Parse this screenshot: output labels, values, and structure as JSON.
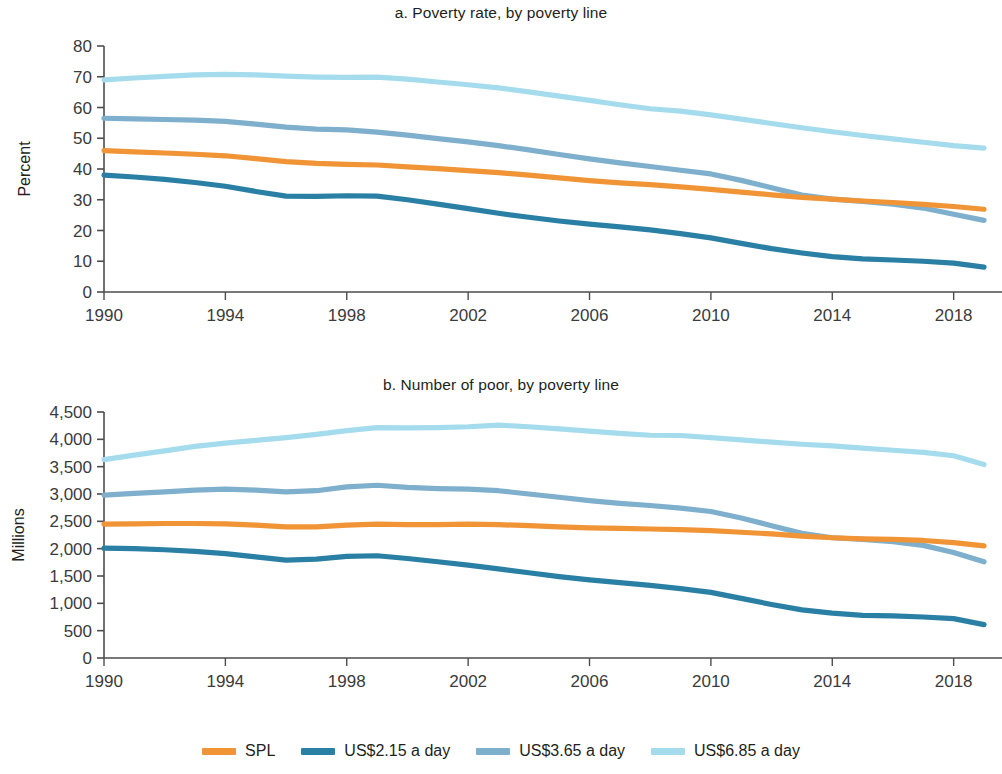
{
  "figure": {
    "panels": [
      {
        "id": "a",
        "title": "a. Poverty rate, by poverty line"
      },
      {
        "id": "b",
        "title": "b. Number of poor, by poverty line"
      }
    ]
  },
  "legend": {
    "items": [
      {
        "label": "SPL",
        "color": "#f09436"
      },
      {
        "label": "US$2.15 a day",
        "color": "#2a7fa5"
      },
      {
        "label": "US$3.65 a day",
        "color": "#7eafcd"
      },
      {
        "label": "US$6.85 a day",
        "color": "#a5dced"
      }
    ]
  },
  "chart_data": [
    {
      "type": "line",
      "title": "a. Poverty rate, by poverty line",
      "xlabel": "",
      "ylabel": "Percent",
      "xlim": [
        1990,
        2019
      ],
      "ylim": [
        0,
        80
      ],
      "yticks": [
        0,
        10,
        20,
        30,
        40,
        50,
        60,
        70,
        80
      ],
      "ytick_labels": [
        "0",
        "10",
        "20",
        "30",
        "40",
        "50",
        "60",
        "70",
        "80"
      ],
      "xticks": [
        1990,
        1994,
        1998,
        2002,
        2006,
        2010,
        2014,
        2018
      ],
      "xtick_labels": [
        "1990",
        "1994",
        "1998",
        "2002",
        "2006",
        "2010",
        "2014",
        "2018"
      ],
      "grid": false,
      "legend_position": "bottom",
      "x": [
        1990,
        1991,
        1992,
        1993,
        1994,
        1995,
        1996,
        1997,
        1998,
        1999,
        2000,
        2001,
        2002,
        2003,
        2004,
        2005,
        2006,
        2007,
        2008,
        2009,
        2010,
        2011,
        2012,
        2013,
        2014,
        2015,
        2016,
        2017,
        2018,
        2019
      ],
      "series": [
        {
          "name": "US$6.85 a day",
          "color": "#a5dced",
          "values": [
            69.0,
            69.6,
            70.1,
            70.6,
            70.8,
            70.6,
            70.2,
            69.9,
            69.8,
            69.9,
            69.2,
            68.3,
            67.4,
            66.4,
            65.1,
            63.7,
            62.3,
            60.9,
            59.6,
            58.8,
            57.6,
            56.2,
            54.8,
            53.4,
            52.1,
            50.9,
            49.8,
            48.7,
            47.6,
            46.8
          ]
        },
        {
          "name": "US$3.65 a day",
          "color": "#7eafcd",
          "values": [
            56.5,
            56.3,
            56.1,
            55.9,
            55.5,
            54.6,
            53.6,
            53.0,
            52.7,
            52.0,
            51.0,
            49.9,
            48.8,
            47.6,
            46.2,
            44.7,
            43.3,
            42.0,
            40.8,
            39.6,
            38.4,
            36.3,
            33.9,
            31.5,
            30.2,
            29.5,
            28.6,
            27.3,
            25.3,
            23.3
          ]
        },
        {
          "name": "SPL",
          "color": "#f09436",
          "values": [
            46.0,
            45.6,
            45.2,
            44.8,
            44.3,
            43.4,
            42.4,
            41.8,
            41.5,
            41.3,
            40.7,
            40.1,
            39.5,
            38.8,
            38.0,
            37.1,
            36.2,
            35.5,
            34.9,
            34.2,
            33.4,
            32.5,
            31.6,
            30.8,
            30.2,
            29.6,
            29.1,
            28.5,
            27.8,
            26.9
          ]
        },
        {
          "name": "US$2.15 a day",
          "color": "#2a7fa5",
          "values": [
            38.0,
            37.4,
            36.6,
            35.6,
            34.4,
            32.7,
            31.2,
            31.1,
            31.3,
            31.2,
            30.0,
            28.6,
            27.1,
            25.6,
            24.3,
            23.1,
            22.1,
            21.2,
            20.2,
            19.0,
            17.6,
            15.8,
            14.1,
            12.7,
            11.5,
            10.8,
            10.4,
            10.0,
            9.4,
            8.1
          ]
        }
      ]
    },
    {
      "type": "line",
      "title": "b. Number of poor, by poverty line",
      "xlabel": "",
      "ylabel": "Millions",
      "xlim": [
        1990,
        2019
      ],
      "ylim": [
        0,
        4500
      ],
      "yticks": [
        0,
        500,
        1000,
        1500,
        2000,
        2500,
        3000,
        3500,
        4000,
        4500
      ],
      "ytick_labels": [
        "0",
        "500",
        "1,000",
        "1,500",
        "2,000",
        "2,500",
        "3,000",
        "3,500",
        "4,000",
        "4,500"
      ],
      "xticks": [
        1990,
        1994,
        1998,
        2002,
        2006,
        2010,
        2014,
        2018
      ],
      "xtick_labels": [
        "1990",
        "1994",
        "1998",
        "2002",
        "2006",
        "2010",
        "2014",
        "2018"
      ],
      "grid": false,
      "legend_position": "bottom",
      "x": [
        1990,
        1991,
        1992,
        1993,
        1994,
        1995,
        1996,
        1997,
        1998,
        1999,
        2000,
        2001,
        2002,
        2003,
        2004,
        2005,
        2006,
        2007,
        2008,
        2009,
        2010,
        2011,
        2012,
        2013,
        2014,
        2015,
        2016,
        2017,
        2018,
        2019
      ],
      "series": [
        {
          "name": "US$6.85 a day",
          "color": "#a5dced",
          "values": [
            3630,
            3710,
            3790,
            3870,
            3930,
            3980,
            4030,
            4090,
            4160,
            4215,
            4210,
            4215,
            4230,
            4260,
            4230,
            4190,
            4150,
            4110,
            4075,
            4070,
            4030,
            3990,
            3950,
            3910,
            3880,
            3840,
            3800,
            3760,
            3700,
            3540
          ]
        },
        {
          "name": "US$3.65 a day",
          "color": "#7eafcd",
          "values": [
            2980,
            3010,
            3040,
            3070,
            3090,
            3070,
            3040,
            3060,
            3130,
            3160,
            3120,
            3100,
            3090,
            3060,
            3000,
            2940,
            2880,
            2830,
            2790,
            2740,
            2680,
            2560,
            2420,
            2280,
            2200,
            2170,
            2130,
            2060,
            1930,
            1760
          ]
        },
        {
          "name": "SPL",
          "color": "#f09436",
          "values": [
            2450,
            2455,
            2460,
            2460,
            2455,
            2430,
            2400,
            2400,
            2430,
            2450,
            2440,
            2440,
            2450,
            2440,
            2420,
            2400,
            2380,
            2370,
            2360,
            2350,
            2330,
            2300,
            2270,
            2230,
            2200,
            2180,
            2170,
            2150,
            2110,
            2050
          ]
        },
        {
          "name": "US$2.15 a day",
          "color": "#2a7fa5",
          "values": [
            2010,
            2000,
            1980,
            1950,
            1910,
            1850,
            1790,
            1810,
            1860,
            1870,
            1820,
            1760,
            1700,
            1630,
            1560,
            1490,
            1430,
            1380,
            1330,
            1270,
            1200,
            1090,
            980,
            880,
            820,
            780,
            770,
            750,
            720,
            610
          ]
        }
      ]
    }
  ]
}
